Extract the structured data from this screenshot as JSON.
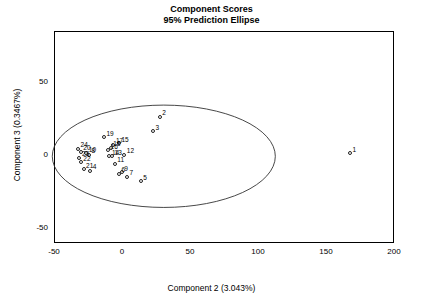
{
  "chart_data": {
    "type": "scatter",
    "title": "Component Scores",
    "subtitle": "95% Prediction Ellipse",
    "xlabel": "Component 2 (3.043%)",
    "ylabel": "Component 3 (0.3467%)",
    "xlim": [
      -50,
      200
    ],
    "ylim": [
      -60,
      85
    ],
    "xticks": [
      -50,
      0,
      50,
      100,
      150,
      200
    ],
    "xtick_labels": [
      "-50",
      "0",
      "50",
      "100",
      "150",
      "200"
    ],
    "yticks": [
      -50,
      0,
      50
    ],
    "ytick_labels": [
      "-50",
      "0",
      "50"
    ],
    "grid": false,
    "legend": "none",
    "annotation": "95% prediction ellipse drawn around the point cloud",
    "ellipse": {
      "center_x": 30,
      "center_y": 0,
      "semi_axis_x": 82,
      "semi_axis_y": 35
    },
    "points": [
      {
        "label": "1",
        "x": 167,
        "y": 2
      },
      {
        "label": "2",
        "x": 27,
        "y": 27
      },
      {
        "label": "3",
        "x": 22,
        "y": 17
      },
      {
        "label": "4",
        "x": -24,
        "y": -10
      },
      {
        "label": "5",
        "x": 13,
        "y": -17
      },
      {
        "label": "6",
        "x": -3,
        "y": -12
      },
      {
        "label": "7",
        "x": 3,
        "y": -14
      },
      {
        "label": "8",
        "x": -25,
        "y": 1
      },
      {
        "label": "9",
        "x": -1,
        "y": -11
      },
      {
        "label": "10",
        "x": -27,
        "y": 2
      },
      {
        "label": "11",
        "x": -6,
        "y": -5
      },
      {
        "label": "12",
        "x": 1,
        "y": 1
      },
      {
        "label": "13",
        "x": -8,
        "y": 0
      },
      {
        "label": "14",
        "x": -10,
        "y": 0
      },
      {
        "label": "15",
        "x": -3,
        "y": 9
      },
      {
        "label": "16",
        "x": -11,
        "y": 4
      },
      {
        "label": "17",
        "x": -7,
        "y": 8
      },
      {
        "label": "18",
        "x": -9,
        "y": 6
      },
      {
        "label": "19",
        "x": -14,
        "y": 13
      },
      {
        "label": "20",
        "x": -31,
        "y": 3
      },
      {
        "label": "21",
        "x": -29,
        "y": -9
      },
      {
        "label": "22",
        "x": -31,
        "y": -4
      },
      {
        "label": "23",
        "x": -32,
        "y": -1
      },
      {
        "label": "24",
        "x": -33,
        "y": 5
      }
    ]
  }
}
